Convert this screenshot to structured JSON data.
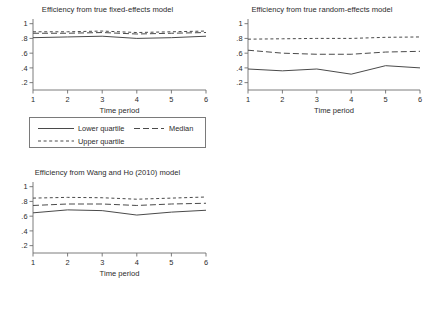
{
  "figure": {
    "axis_label": "Time period",
    "y_ticks": [
      "1",
      ".8",
      ".6",
      ".4",
      ".2"
    ],
    "x_ticks": [
      "1",
      "2",
      "3",
      "4",
      "5",
      "6"
    ],
    "legend_labels": {
      "lower": "Lower quartile",
      "median": "Median",
      "upper": "Upper quartile"
    }
  },
  "chart_data": [
    {
      "type": "line",
      "title": "Efficiency from true fixed-effects model",
      "xlabel": "Time period",
      "ylabel": "",
      "x": [
        1,
        2,
        3,
        4,
        5,
        6
      ],
      "xlim": [
        1,
        6
      ],
      "ylim": [
        0.1,
        1.05
      ],
      "yticks": [
        0.2,
        0.4,
        0.6,
        0.8,
        1.0
      ],
      "grid": false,
      "legend_position": "below",
      "series": [
        {
          "name": "Lower quartile",
          "style": "solid",
          "values": [
            0.81,
            0.82,
            0.83,
            0.8,
            0.81,
            0.83
          ]
        },
        {
          "name": "Median",
          "style": "long-dash",
          "values": [
            0.87,
            0.87,
            0.88,
            0.86,
            0.87,
            0.88
          ]
        },
        {
          "name": "Upper quartile",
          "style": "short-dash",
          "values": [
            0.89,
            0.89,
            0.9,
            0.88,
            0.89,
            0.9
          ]
        }
      ]
    },
    {
      "type": "line",
      "title": "Efficiency from true random-effects model",
      "xlabel": "Time period",
      "ylabel": "",
      "x": [
        1,
        2,
        3,
        4,
        5,
        6
      ],
      "xlim": [
        1,
        6
      ],
      "ylim": [
        0.1,
        1.05
      ],
      "yticks": [
        0.2,
        0.4,
        0.6,
        0.8,
        1.0
      ],
      "grid": false,
      "legend_position": "below",
      "series": [
        {
          "name": "Lower quartile",
          "style": "solid",
          "values": [
            0.385,
            0.36,
            0.385,
            0.315,
            0.43,
            0.4
          ]
        },
        {
          "name": "Median",
          "style": "long-dash",
          "values": [
            0.64,
            0.6,
            0.585,
            0.585,
            0.615,
            0.625
          ]
        },
        {
          "name": "Upper quartile",
          "style": "short-dash",
          "values": [
            0.79,
            0.795,
            0.8,
            0.8,
            0.815,
            0.82
          ]
        }
      ]
    },
    {
      "type": "line",
      "title": "Efficiency from Wang and Ho (2010) model",
      "xlabel": "Time period",
      "ylabel": "",
      "x": [
        1,
        2,
        3,
        4,
        5,
        6
      ],
      "xlim": [
        1,
        6
      ],
      "ylim": [
        0.1,
        1.05
      ],
      "yticks": [
        0.2,
        0.4,
        0.6,
        0.8,
        1.0
      ],
      "grid": false,
      "legend_position": "below",
      "series": [
        {
          "name": "Lower quartile",
          "style": "solid",
          "values": [
            0.645,
            0.685,
            0.675,
            0.615,
            0.655,
            0.68
          ]
        },
        {
          "name": "Median",
          "style": "long-dash",
          "values": [
            0.745,
            0.765,
            0.765,
            0.745,
            0.765,
            0.775
          ]
        },
        {
          "name": "Upper quartile",
          "style": "short-dash",
          "values": [
            0.845,
            0.855,
            0.85,
            0.83,
            0.845,
            0.86
          ]
        }
      ]
    }
  ]
}
